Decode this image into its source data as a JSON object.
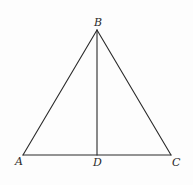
{
  "diagram": {
    "type": "geometry-triangle",
    "background": "#fdfdfd",
    "stroke_color": "#2a2a2a",
    "points": {
      "A": {
        "label": "A",
        "x": 23,
        "y": 155
      },
      "B": {
        "label": "B",
        "x": 97,
        "y": 30
      },
      "C": {
        "label": "C",
        "x": 171,
        "y": 155
      },
      "D": {
        "label": "D",
        "x": 97,
        "y": 155
      }
    },
    "segments": [
      {
        "from": "A",
        "to": "B"
      },
      {
        "from": "B",
        "to": "C"
      },
      {
        "from": "A",
        "to": "C"
      },
      {
        "from": "B",
        "to": "D"
      }
    ],
    "labels": {
      "A": "A",
      "B": "B",
      "C": "C",
      "D": "D"
    }
  }
}
